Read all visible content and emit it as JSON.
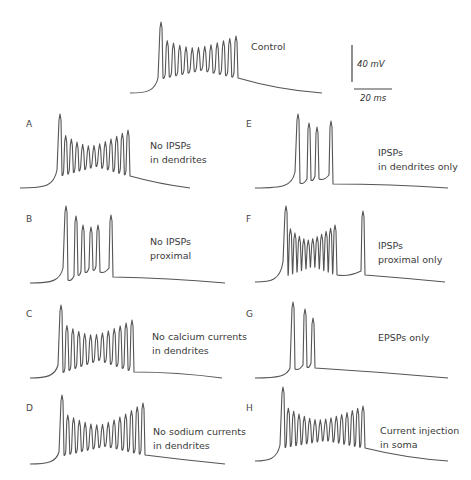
{
  "scale_bar": {
    "voltage": "40 mV",
    "time": "20 ms"
  },
  "panels": [
    {
      "id": "control",
      "letter": "",
      "caption": [
        "Control"
      ]
    },
    {
      "id": "A",
      "letter": "A",
      "caption": [
        "No IPSPs",
        "in dendrites"
      ]
    },
    {
      "id": "B",
      "letter": "B",
      "caption": [
        "No IPSPs",
        "proximal"
      ]
    },
    {
      "id": "C",
      "letter": "C",
      "caption": [
        "No calcium currents",
        "in dendrites"
      ]
    },
    {
      "id": "D",
      "letter": "D",
      "caption": [
        "No sodium currents",
        "in dendrites"
      ]
    },
    {
      "id": "E",
      "letter": "E",
      "caption": [
        "IPSPs",
        "in dendrites only"
      ]
    },
    {
      "id": "F",
      "letter": "F",
      "caption": [
        "IPSPs",
        "proximal only"
      ]
    },
    {
      "id": "G",
      "letter": "G",
      "caption": [
        "EPSPs only"
      ]
    },
    {
      "id": "H",
      "letter": "H",
      "caption": [
        "Current injection",
        "in soma"
      ]
    }
  ],
  "chart_data": {
    "type": "line",
    "units": {
      "y": "mV",
      "x": "ms"
    },
    "scale_bars": {
      "y": "40 mV",
      "x": "20 ms"
    },
    "traces": [
      {
        "name": "Control",
        "spike_count": 13
      },
      {
        "name": "A: No IPSPs in dendrites",
        "spike_count": 13
      },
      {
        "name": "B: No IPSPs proximal",
        "spike_count": 6
      },
      {
        "name": "C: No calcium currents in dendrites",
        "spike_count": 13
      },
      {
        "name": "D: No sodium currents in dendrites",
        "spike_count": 15
      },
      {
        "name": "E: IPSPs in dendrites only",
        "spike_count": 4
      },
      {
        "name": "F: IPSPs proximal only",
        "spike_count": 13
      },
      {
        "name": "G: EPSPs only",
        "spike_count": 3
      },
      {
        "name": "H: Current injection in soma",
        "spike_count": 16
      }
    ]
  }
}
